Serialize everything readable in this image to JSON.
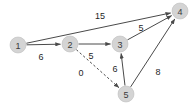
{
  "figure": {
    "background_color": "#ffffff",
    "node_fill_color": "#d4d4d4",
    "node_stroke_color": "#bdbdbd",
    "edge_color": "#4a4a4a",
    "label_color": "#1f1f1f"
  },
  "chart_data": {
    "type": "diagram",
    "diagram_type": "directed-weighted-graph",
    "title": "",
    "directed": true,
    "nodes": [
      {
        "id": "1",
        "label": "1",
        "x": 18,
        "y": 45,
        "r": 8
      },
      {
        "id": "2",
        "label": "2",
        "x": 70,
        "y": 44,
        "r": 8
      },
      {
        "id": "3",
        "label": "3",
        "x": 120,
        "y": 44,
        "r": 8
      },
      {
        "id": "4",
        "label": "4",
        "x": 180,
        "y": 11,
        "r": 8
      },
      {
        "id": "5",
        "label": "5",
        "x": 126,
        "y": 94,
        "r": 8
      }
    ],
    "edges": [
      {
        "from": "1",
        "to": "4",
        "weight": 15,
        "style": "solid",
        "label_x": 100,
        "label_y": 16
      },
      {
        "from": "1",
        "to": "2",
        "weight": 6,
        "style": "solid",
        "label_x": 41,
        "label_y": 57
      },
      {
        "from": "2",
        "to": "3",
        "weight": 5,
        "style": "solid",
        "label_x": 91,
        "label_y": 56
      },
      {
        "from": "2",
        "to": "5",
        "weight": 0,
        "style": "dashed",
        "label_x": 81,
        "label_y": 73
      },
      {
        "from": "3",
        "to": "4",
        "weight": 5,
        "style": "solid",
        "label_x": 141,
        "label_y": 28
      },
      {
        "from": "5",
        "to": "3",
        "weight": 6,
        "style": "solid",
        "label_x": 115,
        "label_y": 69
      },
      {
        "from": "5",
        "to": "4",
        "weight": 8,
        "style": "solid",
        "label_x": 158,
        "label_y": 72
      }
    ],
    "legend": [],
    "annotations": []
  }
}
